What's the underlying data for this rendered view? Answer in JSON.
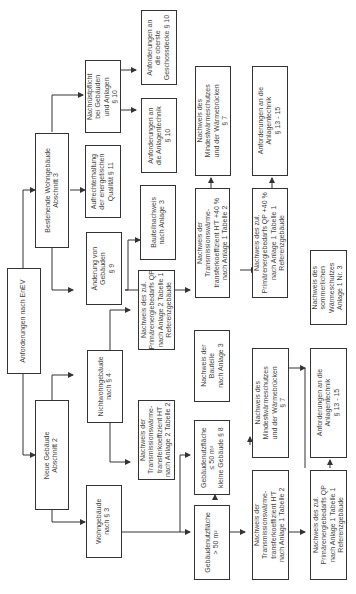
{
  "diagram": {
    "title": "Anforderungen nach EnEV",
    "nodes": {
      "root": "Anforderungen nach EnEV",
      "neue_gebaeude": "Neue Gebäude\nAbschnitt 2",
      "bestehende": "Bestehende Wohngebäude\nAbschnitt 3",
      "wohngebaeude": "Wohngebäude\nnach § 3",
      "nichtwohngebaeude": "Nichtwohngebäude\nnach § 4",
      "aenderung": "Änderung von\nGebäuden\n§ 9",
      "aufrecht": "Aufrechterhaltung\nder energetischen\nQualität § 11",
      "nachrustpflicht": "Nachrüstpflicht\nbei Gebäuden\nund Anlagen\n§ 10",
      "anf_anlagentechnik_10": "Anforderungen an\ndie Anlagentechnik\n§ 10",
      "anf_geschossdecke": "Anforderungen an\ndie oberste\nGeschossdecke § 10",
      "bauteilnachweis": "Bauteilnachweis\nnach Anlage 3",
      "aend_transmission": "Nachweis der\nTransmissionswärme-\ntransferkoeffizient H'T +40 %\nnach Anlage 1 Tabelle 2",
      "aend_primaer": "Nachweis des zul.\nPrimärenergiebedarfs QP +40 %\nnach Anlage 1 Tabelle 1\nReferenzgebäude",
      "aend_mindest": "Nachweis des\nMindestwärmeschutzes\nund der Wärmebrücken\n§ 7",
      "aend_anlagentechnik": "Anforderungen an die\nAnlagentechnik\n§ 13 - 15",
      "nwg_primaer": "Nachweis des zul.\nPrimärenergiebedarfs QP\nnach Anlage 2 Tabelle 1\nReferenzgebäude",
      "nwg_transmission": "Nachweis der\nTransmissionswärme-\ntransferkoeffizient HT\nnach Anlage 2 Tabelle 2",
      "klein": "Gebäudenutzfläche\n≤ 50 m²\nkleine Gebäude § 8",
      "gross": "Gebäudenutzfläche\n> 50 m²",
      "bauteile_anl3": "Nachweis der\nBauteile\nnach Anlage 3",
      "wg_mindest": "Nachweis des\nMindestwärmeschutzes\nund der Wärmebrücken\n§ 7",
      "wg_anlagentechnik": "Anforderungen an die\nAnlagentechnik\n§ 13 - 15",
      "wg_transmission": "Nachweis der\nTransmissionswärme-\ntransferkoeffizient H'T\nnach Anlage 1 Tabelle 2",
      "wg_primaer": "Nachweis des zul.\nPrimärenergiebedarfs QP\nnach Anlage 1 Tabelle 1\nReferenzgebäude",
      "sommer": "Nachweis des\nsommerlichen\nWärmeschutzes\nAnlage 1 Nr. 3"
    },
    "colors": {
      "line": "#333333",
      "text": "#444444",
      "background": "#ffffff"
    }
  }
}
